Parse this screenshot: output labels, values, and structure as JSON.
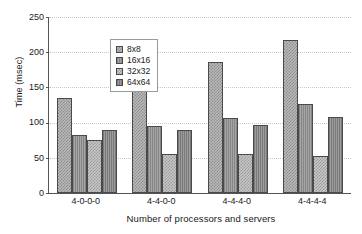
{
  "chart_data": {
    "type": "bar",
    "title": "",
    "xlabel": "Number of processors and servers",
    "ylabel": "Time (msec)",
    "ylim": [
      0,
      250
    ],
    "yticks": [
      0,
      50,
      100,
      150,
      200,
      250
    ],
    "grid": true,
    "legend_position": "upper left",
    "categories": [
      "4-0-0-0",
      "4-4-0-0",
      "4-4-4-0",
      "4-4-4-4"
    ],
    "series": [
      {
        "name": "8x8",
        "values": [
          135,
          166,
          186,
          218
        ]
      },
      {
        "name": "16x16",
        "values": [
          82,
          95,
          106,
          126
        ]
      },
      {
        "name": "32x32",
        "values": [
          76,
          56,
          55,
          53
        ]
      },
      {
        "name": "64x64",
        "values": [
          90,
          89,
          96,
          108
        ]
      }
    ]
  },
  "axes": {
    "y_title": "Time (msec)",
    "x_title": "Number of processors and servers",
    "y_ticks": [
      "250",
      "200",
      "150",
      "100",
      "50",
      "0"
    ],
    "x_ticks": [
      "4-0-0-0",
      "4-4-0-0",
      "4-4-4-0",
      "4-4-4-4"
    ]
  },
  "legend": {
    "items": [
      {
        "label": "8x8"
      },
      {
        "label": "16x16"
      },
      {
        "label": "32x32"
      },
      {
        "label": "64x64"
      }
    ]
  },
  "colors": {
    "series_1": "#b9b9b9",
    "series_2": "#9a9a9a",
    "series_3": "#c7c7c7",
    "series_4": "#8f8f8f",
    "axis": "#555555",
    "grid": "#c9c9c9",
    "text": "#1a1a1a",
    "background": "#ffffff"
  }
}
